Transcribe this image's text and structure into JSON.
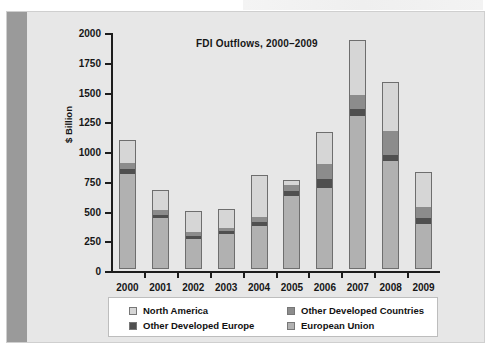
{
  "figure": {
    "background_color": "#e6e6e6",
    "gutter_color": "#9a9a9a"
  },
  "chart_data": {
    "type": "bar",
    "subtype": "stacked",
    "title": "FDI Outflows, 2000–2009",
    "xlabel": "",
    "ylabel": "$ Billion",
    "ylim": [
      0,
      2000
    ],
    "yticks": [
      0,
      250,
      500,
      750,
      1000,
      1250,
      1500,
      1750,
      2000
    ],
    "ytick_labels": [
      "0",
      "250",
      "500",
      "750",
      "1000",
      "1250",
      "1500",
      "1750",
      "2000"
    ],
    "grid": false,
    "legend_position": "below-axes",
    "categories": [
      "2000",
      "2001",
      "2002",
      "2003",
      "2004",
      "2005",
      "2006",
      "2007",
      "2008",
      "2009"
    ],
    "series": [
      {
        "name": "European Union",
        "color": "#b1b1b1",
        "values": [
          800,
          430,
          255,
          295,
          360,
          615,
          680,
          1285,
          905,
          375
        ]
      },
      {
        "name": "Other Developed Europe",
        "color": "#4f4f4f",
        "values": [
          45,
          30,
          25,
          25,
          35,
          45,
          75,
          60,
          55,
          50
        ]
      },
      {
        "name": "Other Developed Countries",
        "color": "#8c8c8c",
        "values": [
          55,
          40,
          30,
          30,
          45,
          50,
          135,
          125,
          200,
          100
        ]
      },
      {
        "name": "North America",
        "color": "#d6d6d6",
        "values": [
          185,
          160,
          175,
          155,
          350,
          40,
          265,
          455,
          410,
          290
        ]
      }
    ],
    "totals": [
      1085,
      660,
      485,
      505,
      790,
      750,
      1155,
      1925,
      1570,
      815
    ]
  },
  "legend": {
    "entries": [
      {
        "label": "North America",
        "color": "#d6d6d6"
      },
      {
        "label": "Other Developed Europe",
        "color": "#4f4f4f"
      },
      {
        "label": "Other Developed Countries",
        "color": "#8c8c8c"
      },
      {
        "label": "European Union",
        "color": "#b1b1b1"
      }
    ]
  }
}
